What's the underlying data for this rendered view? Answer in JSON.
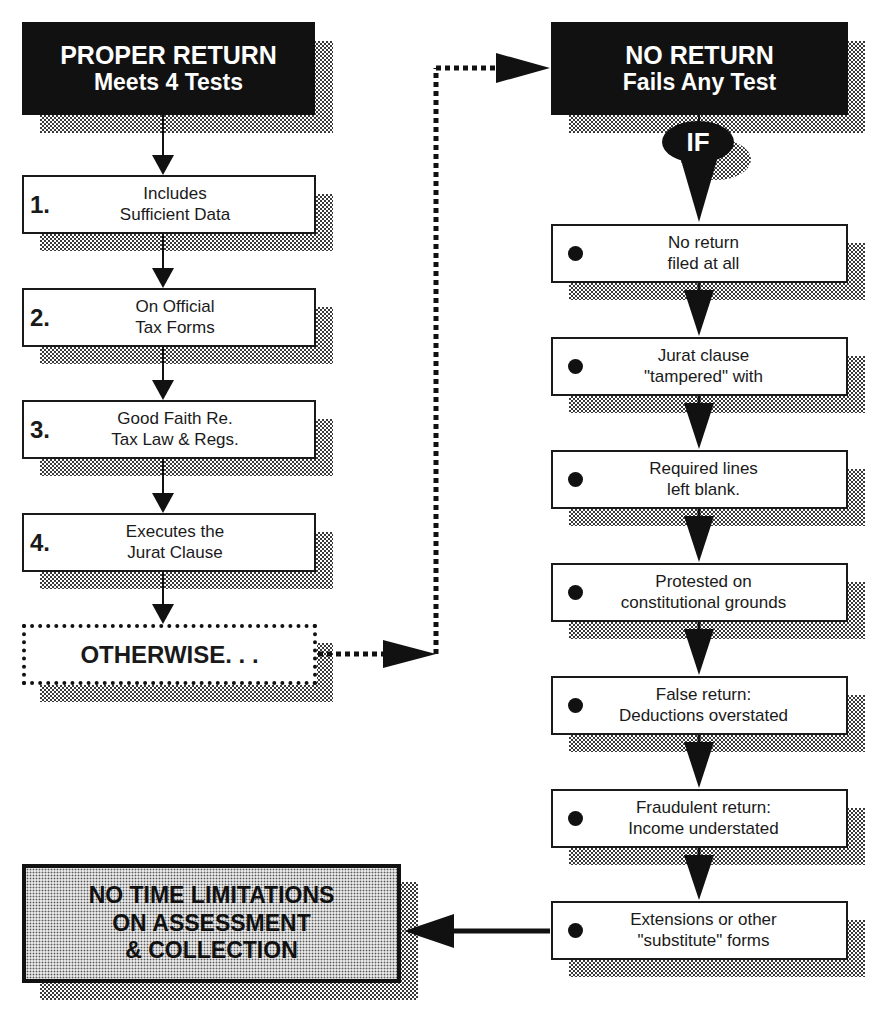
{
  "left_column": {
    "header": {
      "line1": "PROPER RETURN",
      "line2": "Meets 4 Tests"
    },
    "tests": [
      {
        "number": "1.",
        "line1": "Includes",
        "line2": "Sufficient Data"
      },
      {
        "number": "2.",
        "line1": "On Official",
        "line2": "Tax Forms"
      },
      {
        "number": "3.",
        "line1": "Good Faith Re.",
        "line2": "Tax Law & Regs."
      },
      {
        "number": "4.",
        "line1": "Executes the",
        "line2": "Jurat Clause"
      }
    ],
    "otherwise": "OTHERWISE. . ."
  },
  "right_column": {
    "header": {
      "line1": "NO RETURN",
      "line2": "Fails Any Test"
    },
    "condition": "IF",
    "conditions": [
      {
        "line1": "No return",
        "line2": "filed at all"
      },
      {
        "line1": "Jurat clause",
        "line2": "\"tampered\" with"
      },
      {
        "line1": "Required lines",
        "line2": "left blank."
      },
      {
        "line1": "Protested on",
        "line2": "constitutional grounds"
      },
      {
        "line1": "False return:",
        "line2": "Deductions overstated"
      },
      {
        "line1": "Fraudulent return:",
        "line2": "Income understated"
      },
      {
        "line1": "Extensions or other",
        "line2": "\"substitute\" forms"
      }
    ]
  },
  "result": {
    "line1": "NO TIME LIMITATIONS",
    "line2": "ON ASSESSMENT",
    "line3": "& COLLECTION"
  },
  "colors": {
    "ink": "#111111",
    "paper": "#ffffff",
    "shadow": "#3a3a3a"
  }
}
